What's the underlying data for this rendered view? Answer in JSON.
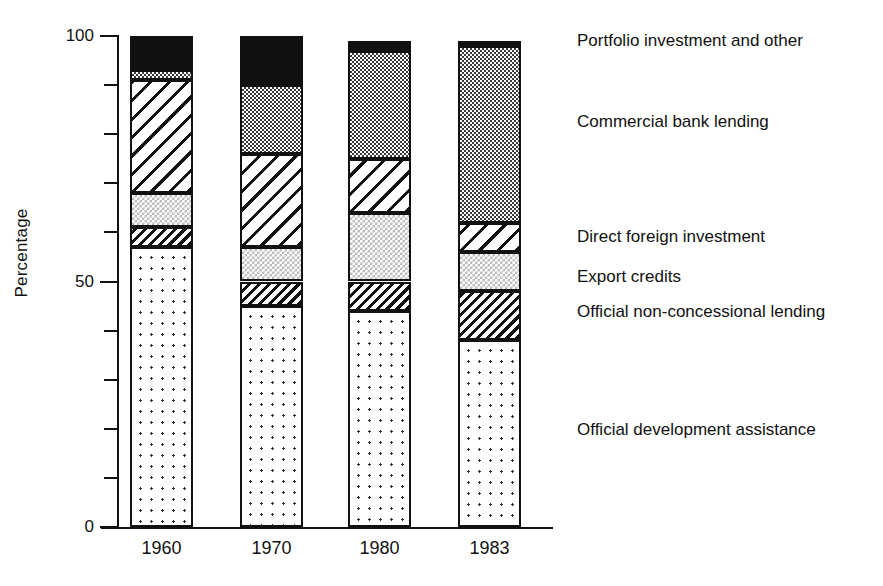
{
  "axes": {
    "y_title": "Percentage",
    "y_tick_labels": [
      "100",
      "50",
      "0"
    ],
    "x_tick_labels": [
      "1960",
      "1970",
      "1980",
      "1983"
    ]
  },
  "legend": {
    "items": [
      {
        "key": "portfolio",
        "label": "Portfolio investment and other",
        "pattern": "solid-black",
        "color": "#111111"
      },
      {
        "key": "commercial",
        "label": "Commercial bank lending",
        "pattern": "checker-dark",
        "color": "#6b6b6b"
      },
      {
        "key": "dfi",
        "label": "Direct foreign investment",
        "pattern": "diagonal-hatch",
        "color": "#ffffff"
      },
      {
        "key": "export",
        "label": "Export credits",
        "pattern": "checker-light",
        "color": "#dcdcdc"
      },
      {
        "key": "nonconc",
        "label": "Official non-concessional lending",
        "pattern": "dense-hatch",
        "color": "#ffffff"
      },
      {
        "key": "oda",
        "label": "Official development assistance",
        "pattern": "dot-grid",
        "color": "#ffffff"
      }
    ]
  },
  "chart_data": {
    "type": "bar",
    "title": "",
    "subtitle": "",
    "xlabel": "",
    "ylabel": "Percentage",
    "ylim": [
      0,
      100
    ],
    "ytick_step": 10,
    "ytick_labeled": [
      0,
      50,
      100
    ],
    "grid": false,
    "stacked": true,
    "legend_position": "right",
    "categories": [
      "1960",
      "1970",
      "1980",
      "1983"
    ],
    "series": [
      {
        "name": "Official development assistance",
        "values": [
          57,
          45,
          44,
          38
        ]
      },
      {
        "name": "Official non-concessional lending",
        "values": [
          4,
          5,
          6,
          10
        ]
      },
      {
        "name": "Export credits",
        "values": [
          7,
          7,
          14,
          8
        ]
      },
      {
        "name": "Direct foreign investment",
        "values": [
          23,
          19,
          11,
          6
        ]
      },
      {
        "name": "Commercial bank lending",
        "values": [
          2,
          14,
          22,
          36
        ]
      },
      {
        "name": "Portfolio investment and other",
        "values": [
          7,
          10,
          2,
          1
        ]
      }
    ]
  }
}
